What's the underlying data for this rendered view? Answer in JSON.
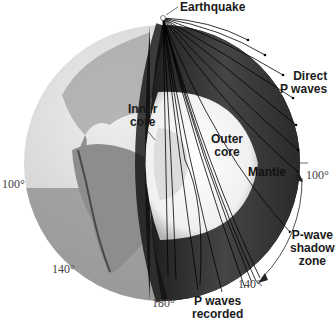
{
  "diagram": {
    "title": "P-wave shadow zone",
    "labels": {
      "earthquake": "Earthquake",
      "direct_p_waves_line1": "Direct",
      "direct_p_waves_line2": "P waves",
      "inner_core_line1": "Inner",
      "inner_core_line2": "core",
      "outer_core_line1": "Outer",
      "outer_core_line2": "core",
      "mantle": "Mantle",
      "shadow_zone_line1": "P-wave",
      "shadow_zone_line2": "shadow",
      "shadow_zone_line3": "zone",
      "p_waves_recorded_line1": "P waves",
      "p_waves_recorded_line2": "recorded"
    },
    "angles": {
      "right_100": "100°",
      "left_100": "100°",
      "right_140": "140°",
      "left_140": "140°",
      "bottom_180": "180°"
    },
    "colors": {
      "mantle": "#3a3a3a",
      "outer_core": "#f2f2f2",
      "inner_core": "#dcdcdc",
      "globe_ocean": "#d8d8d8",
      "globe_land": "#9a9a9a",
      "shadow_band": "#6e6e6e",
      "arrow": "#ffffff"
    }
  }
}
